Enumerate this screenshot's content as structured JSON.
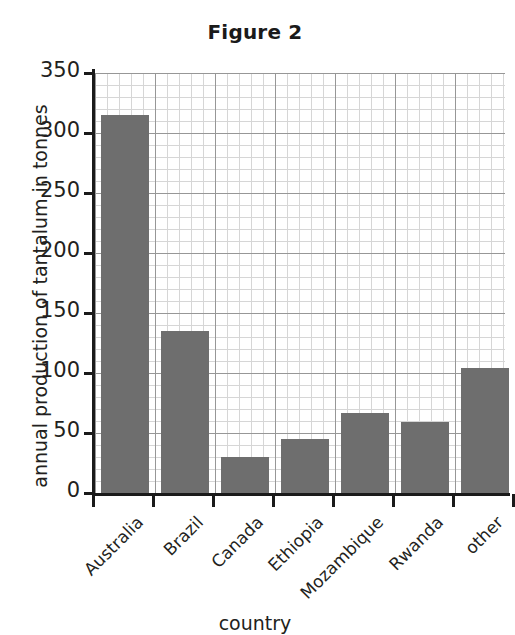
{
  "chart_data": {
    "type": "bar",
    "title": "Figure 2",
    "xlabel": "country",
    "ylabel": "annual production of tantalum in tonnes",
    "categories": [
      "Australia",
      "Brazil",
      "Canada",
      "Ethiopia",
      "Mozambique",
      "Rwanda",
      "other"
    ],
    "values": [
      315,
      135,
      30,
      45,
      67,
      59,
      104
    ],
    "ylim": [
      0,
      350
    ],
    "ytick_labels": [
      "0",
      "50",
      "100",
      "150",
      "200",
      "250",
      "300",
      "350"
    ],
    "ytick_values": [
      0,
      50,
      100,
      150,
      200,
      250,
      300,
      350
    ],
    "y_major_step": 50,
    "y_minor_step": 10,
    "grid": true,
    "legend": "none",
    "bar_color": "#6e6e6e",
    "grid_major_color": "#8d8d8d",
    "grid_minor_color": "#c9c9c9",
    "axis_color": "#1a1a1a",
    "text_color": "#231f20",
    "background": "#ffffff"
  }
}
